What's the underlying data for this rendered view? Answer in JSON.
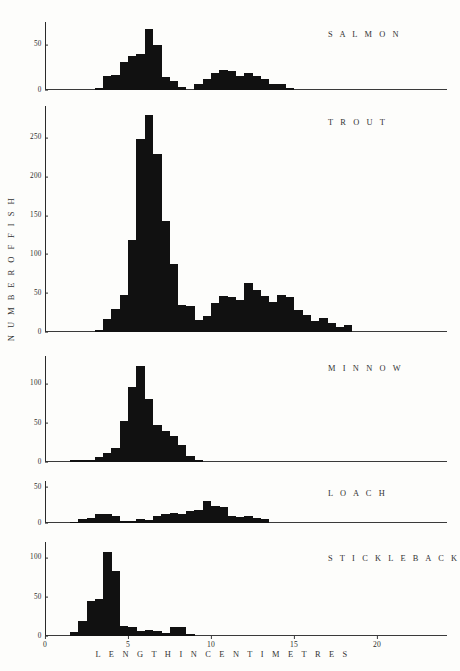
{
  "figure": {
    "ylabel": "N U M B E R   O F   F I S H",
    "xlabel": "L E N G T H   I N   C E N T I M E T R E S",
    "bar_color": "#111111",
    "axis_color": "#2a2a2a"
  },
  "chart_data": {
    "type": "bar",
    "title": "",
    "xlabel": "LENGTH IN CENTIMETRES",
    "ylabel": "NUMBER OF FISH",
    "xlim": [
      0,
      24.2
    ],
    "xticks": [
      0,
      5,
      10,
      15,
      20
    ],
    "xtick_labels": [
      "0",
      "5",
      "10",
      "15",
      "20"
    ],
    "bin_width": 0.5,
    "grid": false,
    "legend": "none",
    "panels": [
      {
        "name": "SALMON",
        "ylim": [
          0,
          75
        ],
        "yticks": [
          0,
          50
        ],
        "ytick_labels": [
          "0",
          "50"
        ],
        "x": [
          3.0,
          3.5,
          4.0,
          4.5,
          5.0,
          5.5,
          6.0,
          6.5,
          7.0,
          7.5,
          8.0,
          8.5,
          9.0,
          9.5,
          10.0,
          10.5,
          11.0,
          11.5,
          12.0,
          12.5,
          13.0,
          13.5,
          14.0,
          14.5
        ],
        "values": [
          2,
          15,
          17,
          31,
          37,
          40,
          67,
          50,
          14,
          10,
          3,
          0,
          7,
          12,
          19,
          22,
          21,
          16,
          19,
          15,
          12,
          7,
          7,
          2
        ]
      },
      {
        "name": "TROUT",
        "ylim": [
          0,
          290
        ],
        "yticks": [
          0,
          50,
          100,
          150,
          200,
          250
        ],
        "ytick_labels": [
          "0",
          "50",
          "100",
          "150",
          "200",
          "250"
        ],
        "x": [
          3.0,
          3.5,
          4.0,
          4.5,
          5.0,
          5.5,
          6.0,
          6.5,
          7.0,
          7.5,
          8.0,
          8.5,
          9.0,
          9.5,
          10.0,
          10.5,
          11.0,
          11.5,
          12.0,
          12.5,
          13.0,
          13.5,
          14.0,
          14.5,
          15.0,
          15.5,
          16.0,
          16.5,
          17.0
        ],
        "values": [
          3,
          17,
          30,
          48,
          118,
          248,
          278,
          228,
          143,
          87,
          35,
          33,
          16,
          20,
          37,
          46,
          45,
          41,
          63,
          54,
          46,
          38,
          48,
          45,
          28,
          22,
          14,
          18,
          11,
          6,
          9
        ]
      },
      {
        "name": "MINNOW",
        "ylim": [
          0,
          135
        ],
        "yticks": [
          0,
          50,
          100
        ],
        "ytick_labels": [
          "0",
          "50",
          "100"
        ],
        "x": [
          1.5,
          2.0,
          2.5,
          3.0,
          3.5,
          4.0,
          4.5,
          5.0,
          5.5,
          6.0,
          6.5,
          7.0,
          7.5,
          8.0
        ],
        "values": [
          2,
          2,
          3,
          7,
          12,
          18,
          52,
          95,
          122,
          80,
          47,
          40,
          33,
          22,
          8,
          3
        ]
      },
      {
        "name": "LOACH",
        "ylim": [
          0,
          58
        ],
        "yticks": [
          0,
          50
        ],
        "ytick_labels": [
          "0",
          "50"
        ],
        "x": [
          1.5,
          2.0,
          2.5,
          3.0,
          3.5,
          4.0,
          4.5,
          5.0,
          5.5,
          6.0,
          6.5,
          7.0,
          7.5,
          8.0,
          8.5,
          9.0,
          9.5,
          10.0
        ],
        "values": [
          2,
          5,
          7,
          12,
          12,
          9,
          3,
          3,
          5,
          4,
          9,
          12,
          14,
          13,
          17,
          18,
          31,
          24,
          22,
          9,
          8,
          9,
          7,
          5
        ]
      },
      {
        "name": "STICKLEBACK",
        "ylim": [
          0,
          120
        ],
        "yticks": [
          0,
          50,
          100
        ],
        "ytick_labels": [
          "0",
          "50",
          "100"
        ],
        "x": [
          1.5,
          2.0,
          2.5,
          3.0,
          3.5,
          4.0,
          4.5,
          5.0,
          5.5,
          6.0,
          6.5
        ],
        "values": [
          5,
          19,
          45,
          47,
          107,
          83,
          13,
          12,
          7,
          8,
          7,
          4,
          12,
          11,
          3
        ]
      }
    ]
  }
}
